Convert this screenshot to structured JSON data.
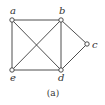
{
  "diagram": {
    "type": "graph",
    "caption": "(a)",
    "nodes": [
      {
        "id": "a",
        "label": "a",
        "x": 12,
        "y": 20,
        "lx": 10,
        "ly": 14
      },
      {
        "id": "b",
        "label": "b",
        "x": 61,
        "y": 20,
        "lx": 59,
        "ly": 14
      },
      {
        "id": "c",
        "label": "c",
        "x": 87,
        "y": 44,
        "lx": 92,
        "ly": 48
      },
      {
        "id": "d",
        "label": "d",
        "x": 61,
        "y": 70,
        "lx": 58,
        "ly": 81
      },
      {
        "id": "e",
        "label": "e",
        "x": 12,
        "y": 70,
        "lx": 10,
        "ly": 81
      }
    ],
    "edges": [
      [
        "a",
        "b"
      ],
      [
        "a",
        "e"
      ],
      [
        "a",
        "d"
      ],
      [
        "b",
        "e"
      ],
      [
        "b",
        "d"
      ],
      [
        "b",
        "c"
      ],
      [
        "c",
        "d"
      ],
      [
        "e",
        "d"
      ]
    ],
    "colors": {
      "stroke": "#3a3a3a",
      "text": "#333333",
      "background": "#ffffff"
    }
  }
}
